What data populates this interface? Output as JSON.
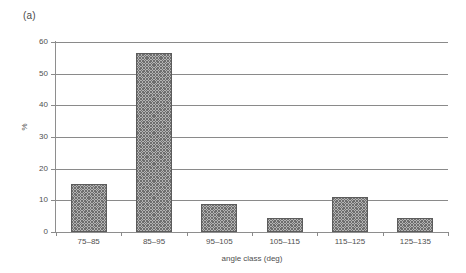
{
  "figure": {
    "panel_label": "(a)",
    "background_color": "#ffffff"
  },
  "chart_data": {
    "type": "bar",
    "title": "",
    "subtitle": "",
    "panel": "(a)",
    "categories": [
      "75–85",
      "85–95",
      "95–105",
      "105–115",
      "115–125",
      "125–135"
    ],
    "values": [
      15.3,
      56.5,
      9.0,
      4.5,
      11.0,
      4.5
    ],
    "series": [
      {
        "name": "%",
        "values": [
          15.3,
          56.5,
          9.0,
          4.5,
          11.0,
          4.5
        ]
      }
    ],
    "xlabel": "angle class (deg)",
    "ylabel": "%",
    "ylim": [
      0,
      60
    ],
    "yticks": [
      0,
      10,
      20,
      30,
      40,
      50,
      60
    ],
    "ytick_labels": [
      "0",
      "10",
      "20",
      "30",
      "40",
      "50",
      "60"
    ],
    "grid": "horizontal",
    "legend": "none",
    "bar_fill": "#b4b4b4",
    "bar_hatch": "crosshatch",
    "bar_edge_color": "#5c5c5c",
    "axis_color": "#8a8a8a",
    "text_color": "#4f4f4f"
  }
}
